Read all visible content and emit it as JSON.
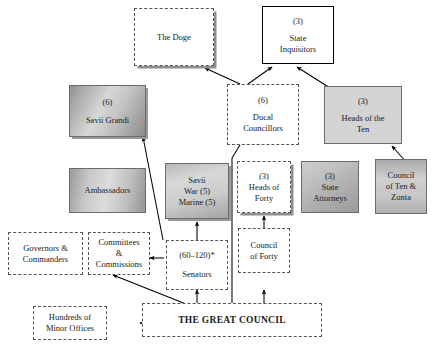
{
  "diagram": {
    "footnote_marker": "*",
    "nodes": [
      {
        "id": "doge",
        "name": "the-doge",
        "lines": [
          "The Doge"
        ]
      },
      {
        "id": "inquisitors",
        "name": "state-inquisitors",
        "lines": [
          "(3)",
          "State",
          "Inquisitors"
        ]
      },
      {
        "id": "savii_grandi",
        "name": "savii-grandi",
        "lines": [
          "(6)",
          "Savii Grandi"
        ]
      },
      {
        "id": "ducal",
        "name": "ducal-councillors",
        "lines": [
          "(6)",
          "Ducal",
          "Councillors"
        ]
      },
      {
        "id": "heads_ten",
        "name": "heads-of-the-ten",
        "lines": [
          "(3)",
          "Heads of the",
          "Ten"
        ]
      },
      {
        "id": "ambassadors",
        "name": "ambassadors",
        "lines": [
          "Ambassadors"
        ]
      },
      {
        "id": "savii_war",
        "name": "savii-war-marine",
        "lines": [
          "Savii",
          "War (5)",
          "Marine (5)"
        ]
      },
      {
        "id": "heads_forty",
        "name": "heads-of-forty",
        "lines": [
          "(3)",
          "Heads of",
          "Forty"
        ]
      },
      {
        "id": "attorneys",
        "name": "state-attorneys",
        "lines": [
          "(3)",
          "State",
          "Attorneys"
        ]
      },
      {
        "id": "ten_zonta",
        "name": "council-of-ten-and-zonta",
        "lines": [
          "Council",
          "of Ten &",
          "Zonta"
        ]
      },
      {
        "id": "governors",
        "name": "governors-and-commanders",
        "lines": [
          "Governors &",
          "Commanders"
        ]
      },
      {
        "id": "committees",
        "name": "committees-and-commissions",
        "lines": [
          "Committees",
          "&",
          "Commissions"
        ]
      },
      {
        "id": "senators",
        "name": "senators",
        "lines": [
          "(60–120)*",
          "Senators"
        ]
      },
      {
        "id": "forty",
        "name": "council-of-forty",
        "lines": [
          "Council",
          "of Forty"
        ]
      },
      {
        "id": "minor",
        "name": "hundreds-of-minor-offices",
        "lines": [
          "Hundreds of",
          "Minor Offices"
        ]
      },
      {
        "id": "great",
        "name": "the-great-council",
        "lines": [
          "THE GREAT COUNCIL"
        ]
      }
    ],
    "colors": {
      "ink": "#1a1a1a",
      "dashed_border": "#555555",
      "solid_border": "#000000",
      "shadow": "#8e8e8e",
      "flat_fill": "#d4d4d4",
      "page": "#ffffff"
    },
    "edges": [
      {
        "from": "ducal",
        "to": "doge",
        "style": "arrow"
      },
      {
        "from": "ducal",
        "to": "inquisitors",
        "style": "arrow"
      },
      {
        "from": "heads_ten",
        "to": "inquisitors",
        "style": "arrow"
      },
      {
        "from": "ten_zonta",
        "to": "heads_ten",
        "style": "arrow"
      },
      {
        "from": "senators",
        "to": "doge",
        "style": "arrow"
      },
      {
        "from": "senators",
        "to": "ducal",
        "style": "arrow"
      },
      {
        "from": "senators",
        "to": "savii_grandi",
        "style": "arrow"
      },
      {
        "from": "senators",
        "to": "savii_war",
        "style": "arrow"
      },
      {
        "from": "senators",
        "to": "committees",
        "style": "arrow"
      },
      {
        "from": "great",
        "to": "senators",
        "style": "arrow"
      },
      {
        "from": "great",
        "to": "forty",
        "style": "arrow"
      },
      {
        "from": "forty",
        "to": "heads_forty",
        "style": "arrow"
      },
      {
        "from": "great",
        "to": "minor",
        "style": "arrow"
      },
      {
        "from": "great",
        "to": "governors",
        "style": "arrow"
      }
    ]
  }
}
